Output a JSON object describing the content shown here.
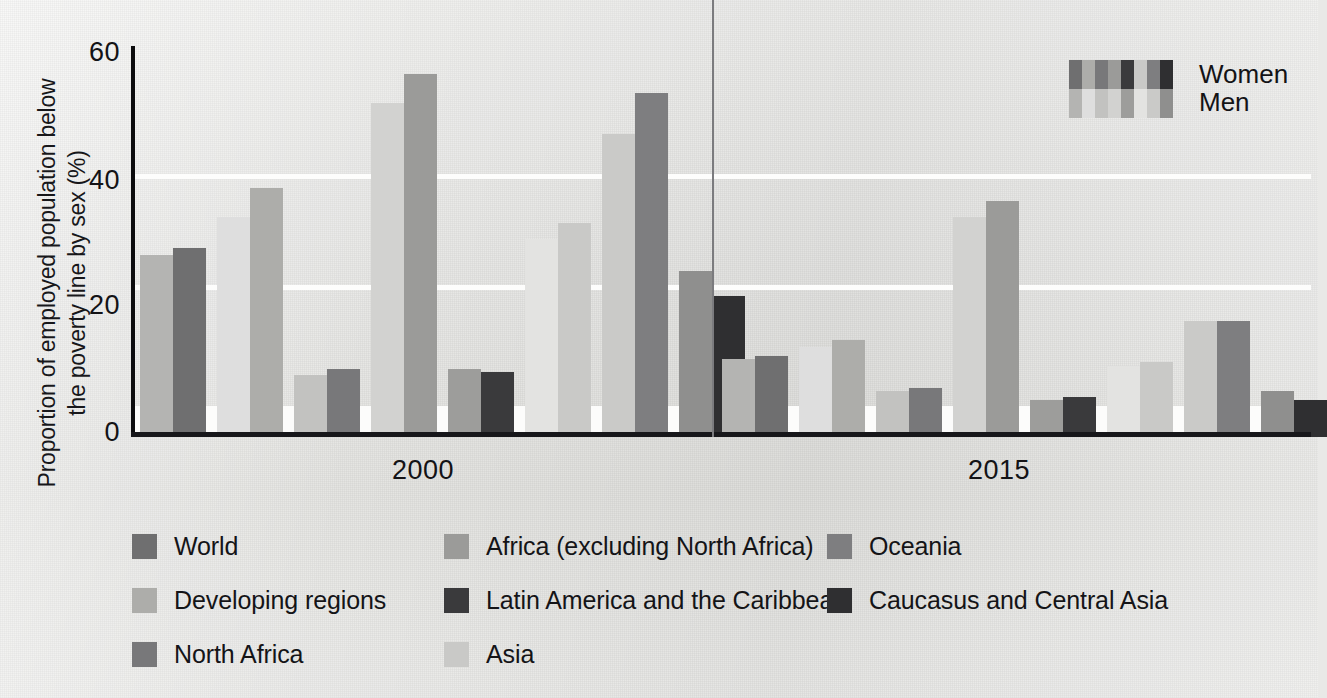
{
  "chart_data": {
    "type": "bar",
    "title": "",
    "xlabel": "",
    "ylabel": "Proportion of employed population below the poverty line by sex (%)",
    "ylim": [
      0,
      60
    ],
    "yticks": [
      "0",
      "20",
      "40",
      "60"
    ],
    "grid": false,
    "legend_position": "top-right and bottom",
    "x": [
      "2000",
      "2015"
    ],
    "group_labels": [
      "2000",
      "2015"
    ],
    "sex_legend": [
      {
        "name": "Women",
        "shade": "dark"
      },
      {
        "name": "Men",
        "shade": "light"
      }
    ],
    "categories": [
      "World",
      "Developing regions",
      "North Africa",
      "Africa (excluding North Africa)",
      "Latin America and the Caribbean",
      "Asia",
      "Oceania",
      "Caucasus and Central Asia"
    ],
    "category_colors": {
      "World": {
        "men": "#b4b4b2",
        "women": "#6f6f70"
      },
      "Developing regions": {
        "men": "#dedede",
        "women": "#adadaa"
      },
      "North Africa": {
        "men": "#c2c2c0",
        "women": "#78787a"
      },
      "Africa (excluding North Africa)": {
        "men": "#d2d2d0",
        "women": "#9b9b99"
      },
      "Latin America and the Caribbean": {
        "men": "#9d9d9b",
        "women": "#3a3a3c"
      },
      "Asia": {
        "men": "#e3e3e1",
        "women": "#c9c9c7"
      },
      "Oceania": {
        "men": "#cacac8",
        "women": "#7e7e80"
      },
      "Caucasus and Central Asia": {
        "men": "#8f8f8e",
        "women": "#2f2f31"
      }
    },
    "series": [
      {
        "name": "2000",
        "values": [
          {
            "category": "World",
            "men": 28,
            "women": 29
          },
          {
            "category": "Developing regions",
            "men": 34,
            "women": 38.5
          },
          {
            "category": "North Africa",
            "men": 9,
            "women": 10
          },
          {
            "category": "Africa (excluding North Africa)",
            "men": 52,
            "women": 56.5
          },
          {
            "category": "Latin America and the Caribbean",
            "men": 10,
            "women": 9.5
          },
          {
            "category": "Asia",
            "men": 30.5,
            "women": 33
          },
          {
            "category": "Oceania",
            "men": 47,
            "women": 53.5
          },
          {
            "category": "Caucasus and Central Asia",
            "men": 25.5,
            "women": 21.5
          }
        ]
      },
      {
        "name": "2015",
        "values": [
          {
            "category": "World",
            "men": 11.5,
            "women": 12
          },
          {
            "category": "Developing regions",
            "men": 13.5,
            "women": 14.5
          },
          {
            "category": "North Africa",
            "men": 6.5,
            "women": 7
          },
          {
            "category": "Africa (excluding North Africa)",
            "men": 34,
            "women": 36.5
          },
          {
            "category": "Latin America and the Caribbean",
            "men": 5,
            "women": 5.5
          },
          {
            "category": "Asia",
            "men": 10.5,
            "women": 11
          },
          {
            "category": "Oceania",
            "men": 17.5,
            "women": 17.5
          },
          {
            "category": "Caucasus and Central Asia",
            "men": 6.5,
            "women": 5
          }
        ]
      }
    ]
  },
  "legend_bottom": [
    {
      "label": "World",
      "color": "#6f6f70"
    },
    {
      "label": "Africa (excluding North Africa)",
      "color": "#9b9b99"
    },
    {
      "label": "Oceania",
      "color": "#7e7e80"
    },
    {
      "label": "Developing regions",
      "color": "#adadaa"
    },
    {
      "label": "Latin America and the Caribbean",
      "color": "#3a3a3c"
    },
    {
      "label": "Caucasus and Central Asia",
      "color": "#2f2f31"
    },
    {
      "label": "North Africa",
      "color": "#78787a"
    },
    {
      "label": "Asia",
      "color": "#c9c9c7"
    }
  ],
  "legend_sex": {
    "women": {
      "label": "Women",
      "swatch": [
        "#6f6f70",
        "#adadaa",
        "#78787a",
        "#9b9b99",
        "#3a3a3c",
        "#c9c9c7",
        "#7e7e80",
        "#2f2f31"
      ]
    },
    "men": {
      "label": "Men",
      "swatch": [
        "#b4b4b2",
        "#dedede",
        "#c2c2c0",
        "#d2d2d0",
        "#9d9d9b",
        "#e3e3e1",
        "#cacac8",
        "#8f8f8e"
      ]
    }
  }
}
